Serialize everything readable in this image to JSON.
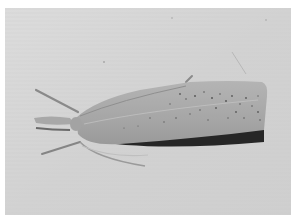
{
  "image": {
    "subject": "moth",
    "description": "Grayscale photograph of a moth resting on a textured pale surface, viewed from above at an angle, head to the left with antennae and legs visible, wings folded into an elongated wedge shape with dark speckles and a dark shadowed lower edge.",
    "style": "black-and-white photograph",
    "colors": {
      "border": "#ffffff",
      "background": "#d6d6d6",
      "background_light": "#e4e4e4",
      "wing": "#a9a9a9",
      "wing_light": "#c2c2c2",
      "wing_dark_edge": "#2a2a2a",
      "speckle": "#555555"
    }
  }
}
